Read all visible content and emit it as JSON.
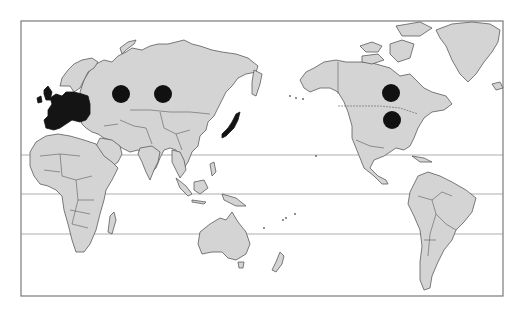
{
  "map": {
    "type": "world map, Pacific-centered projection",
    "colors": {
      "background": "#ffffff",
      "land": "#d4d4d4",
      "borders": "#5a5a5a",
      "highlight": "#141414",
      "marker": "#111111",
      "latitude_lines": "#8a8a8a"
    },
    "highlighted_regions": [
      {
        "name": "Europe"
      },
      {
        "name": "Japan"
      }
    ],
    "markers": [
      {
        "id": "marker-russia-west",
        "region": "Western Russia",
        "cx": 121,
        "cy": 94,
        "r": 9
      },
      {
        "id": "marker-russia-central",
        "region": "Central Russia / Siberia",
        "cx": 163,
        "cy": 94,
        "r": 9
      },
      {
        "id": "marker-canada",
        "region": "Canada",
        "cx": 391,
        "cy": 93,
        "r": 9
      },
      {
        "id": "marker-usa",
        "region": "United States",
        "cx": 392,
        "cy": 120,
        "r": 9
      }
    ],
    "latitude_lines_y": [
      155,
      194,
      234
    ]
  }
}
